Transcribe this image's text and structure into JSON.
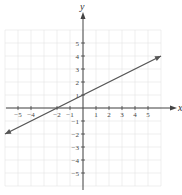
{
  "chart_data": {
    "type": "line",
    "title": "",
    "xlabel": "x",
    "ylabel": "y",
    "xlim": [
      -6,
      6
    ],
    "ylim": [
      -6,
      6
    ],
    "grid": true,
    "x_ticks": [
      -5,
      -4,
      -2,
      -1,
      1,
      2,
      3,
      4,
      5
    ],
    "y_ticks": [
      5,
      4,
      3,
      2,
      1,
      -1,
      -2,
      -3,
      -4,
      -5
    ],
    "series": [
      {
        "name": "line",
        "equation": "y = 0.5x + 1",
        "slope": 0.5,
        "intercept": 1,
        "x": [
          -6,
          -2,
          0,
          6
        ],
        "y": [
          -2,
          0,
          1,
          4
        ],
        "arrows": "both"
      }
    ],
    "colors": {
      "line": "#555555",
      "axis": "#444444",
      "grid": "#e4e4e4"
    }
  }
}
